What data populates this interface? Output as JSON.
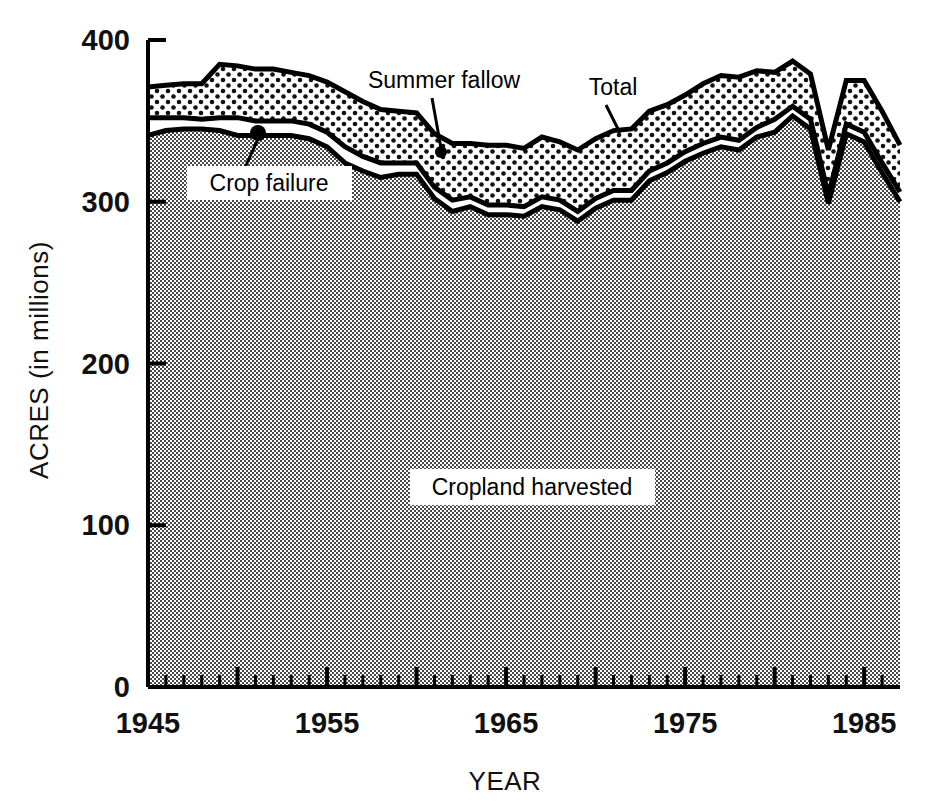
{
  "chart_data": {
    "type": "area",
    "title": "",
    "subtitle": "",
    "xlabel": "YEAR",
    "ylabel": "ACRES (in millions)",
    "xlim": [
      1945,
      1987
    ],
    "ylim": [
      0,
      400
    ],
    "grid": false,
    "legend_position": "in-plot-annotations",
    "stacked": true,
    "x": [
      1945,
      1946,
      1947,
      1948,
      1949,
      1950,
      1951,
      1952,
      1953,
      1954,
      1955,
      1956,
      1957,
      1958,
      1959,
      1960,
      1961,
      1962,
      1963,
      1964,
      1965,
      1966,
      1967,
      1968,
      1969,
      1970,
      1971,
      1972,
      1973,
      1974,
      1975,
      1976,
      1977,
      1978,
      1979,
      1980,
      1981,
      1982,
      1983,
      1984,
      1985,
      1986,
      1987
    ],
    "series": [
      {
        "name": "Cropland harvested",
        "fill": "dark-checker",
        "values": [
          341,
          344,
          345,
          345,
          344,
          341,
          341,
          341,
          341,
          339,
          334,
          324,
          319,
          315,
          317,
          317,
          302,
          294,
          297,
          292,
          292,
          291,
          297,
          295,
          288,
          296,
          301,
          301,
          313,
          318,
          325,
          330,
          334,
          332,
          340,
          343,
          353,
          345,
          299,
          342,
          337,
          318,
          300
        ]
      },
      {
        "name": "Crop failure",
        "fill": "white",
        "values": [
          11,
          8,
          7,
          6,
          8,
          11,
          9,
          9,
          9,
          9,
          9,
          10,
          9,
          9,
          7,
          7,
          7,
          7,
          6,
          6,
          6,
          6,
          6,
          6,
          6,
          6,
          6,
          6,
          6,
          6,
          6,
          6,
          6,
          6,
          6,
          8,
          6,
          6,
          5,
          6,
          6,
          6,
          6
        ]
      },
      {
        "name": "Summer fallow",
        "fill": "light-dots",
        "values": [
          19,
          20,
          21,
          22,
          33,
          32,
          32,
          32,
          30,
          30,
          31,
          34,
          34,
          33,
          32,
          31,
          33,
          35,
          33,
          37,
          37,
          36,
          37,
          36,
          38,
          37,
          37,
          38,
          37,
          36,
          35,
          37,
          38,
          39,
          35,
          29,
          28,
          28,
          28,
          27,
          32,
          32,
          29
        ]
      }
    ],
    "total_values": [
      371,
      372,
      373,
      373,
      385,
      384,
      382,
      382,
      380,
      378,
      374,
      368,
      362,
      357,
      356,
      355,
      342,
      336,
      336,
      335,
      335,
      333,
      340,
      337,
      332,
      339,
      344,
      345,
      356,
      360,
      366,
      373,
      378,
      377,
      381,
      380,
      387,
      379,
      332,
      375,
      375,
      356,
      335
    ],
    "y_ticks": [
      0,
      100,
      200,
      300,
      400
    ],
    "y_tick_labels": [
      "0",
      "100",
      "200",
      "300",
      "400"
    ],
    "x_ticks": [
      1945,
      1955,
      1965,
      1975,
      1985
    ],
    "x_tick_labels": [
      "1945",
      "1955",
      "1965",
      "1975",
      "1985"
    ],
    "x_minor_tick_interval": 1,
    "annotations": [
      {
        "name": "crop-failure",
        "label": "Crop failure",
        "boxed": true
      },
      {
        "name": "summer-fallow",
        "label": "Summer fallow",
        "boxed": false
      },
      {
        "name": "total",
        "label": "Total",
        "boxed": false
      },
      {
        "name": "cropland-harvested",
        "label": "Cropland harvested",
        "boxed": true
      }
    ],
    "colors": {
      "line": "#000000",
      "cropland_fill": "#9a9a9a",
      "crop_failure_fill": "#ffffff",
      "summer_fallow_fill": "#ffffff",
      "text": "#111111"
    }
  }
}
